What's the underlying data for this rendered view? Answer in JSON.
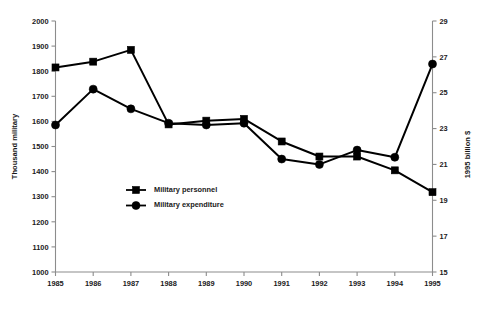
{
  "chart_data": {
    "type": "line",
    "title": "",
    "xlabel": "",
    "categories": [
      "1985",
      "1986",
      "1987",
      "1988",
      "1989",
      "1990",
      "1991",
      "1992",
      "1993",
      "1994",
      "1995"
    ],
    "x": [
      1985,
      1986,
      1987,
      1988,
      1989,
      1990,
      1991,
      1992,
      1993,
      1994,
      1995
    ],
    "grid": false,
    "legend_position": "inside-center-left",
    "axes": {
      "left": {
        "label": "Thousand military",
        "ticks": [
          1000,
          1100,
          1200,
          1300,
          1400,
          1500,
          1600,
          1700,
          1800,
          1900,
          2000
        ],
        "tick_labels": [
          "1000",
          "1100",
          "1200",
          "1300",
          "1400",
          "1500",
          "1600",
          "1700",
          "1800",
          "1900",
          "2000"
        ],
        "ylim": [
          1000,
          2000
        ]
      },
      "right": {
        "label": "1995 billion $",
        "ticks": [
          15,
          17,
          19,
          21,
          23,
          25,
          27,
          29
        ],
        "tick_labels": [
          "15",
          "17",
          "19",
          "21",
          "23",
          "25",
          "27",
          "29"
        ],
        "ylim": [
          15,
          29
        ]
      }
    },
    "series": [
      {
        "name": "Military personnel",
        "axis": "left",
        "marker": "square",
        "color": "#000000",
        "values": [
          1815,
          1838,
          1885,
          1588,
          1603,
          1610,
          1520,
          1460,
          1460,
          1405,
          1318
        ]
      },
      {
        "name": "Military expenditure",
        "axis": "right",
        "marker": "circle",
        "color": "#000000",
        "values": [
          23.2,
          25.2,
          24.1,
          23.3,
          23.2,
          23.3,
          21.3,
          21.0,
          21.8,
          21.4,
          26.6
        ]
      }
    ],
    "legend": [
      {
        "label": "Military personnel",
        "marker": "square"
      },
      {
        "label": "Military expenditure",
        "marker": "circle"
      }
    ]
  }
}
